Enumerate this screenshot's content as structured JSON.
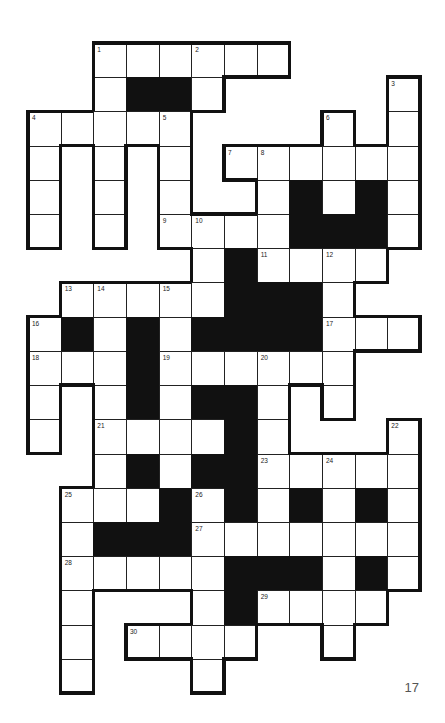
{
  "puzzle": {
    "type": "crossword",
    "rows": 19,
    "cols": 12,
    "grid": [
      "..WWWWWW....",
      "..W##W.....W",
      "WWWWW....W.W",
      "W.W.W.WWWWWW",
      "W.W.W..W#W#W",
      "W.W.WWWW###W",
      ".....W#WWWW.",
      ".WWWWW###W..",
      "W#W#W####WWW",
      "WWW#WWWWWW..",
      "W.W#W##W.W..",
      "W.WWWW#W...W",
      "..W#W##WWWWW",
      ".WWW#W#W#W#W",
      ".W###WWWWWWW",
      ".WWWWW###W#W",
      ".W...W#WWWW.",
      ".W.WWWW..W..",
      ".W...W......"
    ],
    "numbers": [
      {
        "n": "1",
        "r": 0,
        "c": 2
      },
      {
        "n": "2",
        "r": 0,
        "c": 5
      },
      {
        "n": "3",
        "r": 1,
        "c": 11
      },
      {
        "n": "4",
        "r": 2,
        "c": 0
      },
      {
        "n": "5",
        "r": 2,
        "c": 4
      },
      {
        "n": "6",
        "r": 2,
        "c": 9
      },
      {
        "n": "7",
        "r": 3,
        "c": 6
      },
      {
        "n": "8",
        "r": 3,
        "c": 7
      },
      {
        "n": "9",
        "r": 5,
        "c": 4
      },
      {
        "n": "10",
        "r": 5,
        "c": 5
      },
      {
        "n": "11",
        "r": 6,
        "c": 7
      },
      {
        "n": "12",
        "r": 6,
        "c": 9
      },
      {
        "n": "13",
        "r": 7,
        "c": 1
      },
      {
        "n": "14",
        "r": 7,
        "c": 2
      },
      {
        "n": "15",
        "r": 7,
        "c": 4
      },
      {
        "n": "16",
        "r": 8,
        "c": 0
      },
      {
        "n": "17",
        "r": 8,
        "c": 9
      },
      {
        "n": "18",
        "r": 9,
        "c": 0
      },
      {
        "n": "19",
        "r": 9,
        "c": 4
      },
      {
        "n": "20",
        "r": 9,
        "c": 7
      },
      {
        "n": "21",
        "r": 11,
        "c": 2
      },
      {
        "n": "22",
        "r": 11,
        "c": 11
      },
      {
        "n": "23",
        "r": 12,
        "c": 7
      },
      {
        "n": "24",
        "r": 12,
        "c": 9
      },
      {
        "n": "25",
        "r": 13,
        "c": 1
      },
      {
        "n": "26",
        "r": 13,
        "c": 5
      },
      {
        "n": "27",
        "r": 14,
        "c": 5
      },
      {
        "n": "28",
        "r": 15,
        "c": 1
      },
      {
        "n": "29",
        "r": 16,
        "c": 7
      },
      {
        "n": "30",
        "r": 17,
        "c": 3
      }
    ]
  },
  "page": {
    "number": "17"
  },
  "colors": {
    "background": "#ffffff",
    "block": "#111111",
    "line": "#222222",
    "page_number": "#555555"
  }
}
